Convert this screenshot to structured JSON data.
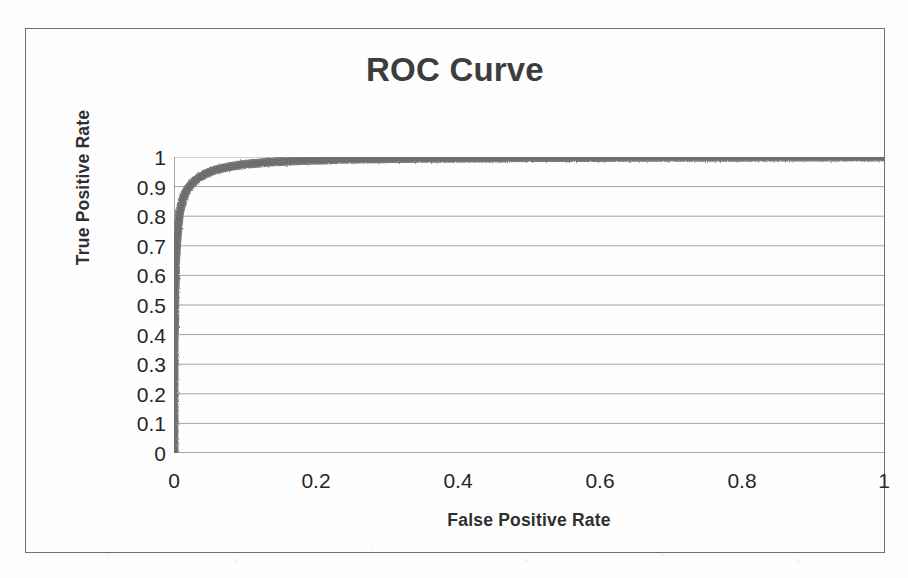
{
  "chart_data": {
    "type": "line",
    "title": "ROC Curve",
    "xlabel": "False Positive Rate",
    "ylabel": "True Positive Rate",
    "xlim": [
      0,
      1
    ],
    "ylim": [
      0,
      1
    ],
    "grid": true,
    "legend": "none",
    "series_color": "#7b7b7b",
    "x_ticks": [
      "0",
      "0.2",
      "0.4",
      "0.6",
      "0.8",
      "1"
    ],
    "x_tick_values": [
      0,
      0.2,
      0.4,
      0.6,
      0.8,
      1
    ],
    "y_ticks": [
      "0",
      "0.1",
      "0.2",
      "0.3",
      "0.4",
      "0.5",
      "0.6",
      "0.7",
      "0.8",
      "0.9",
      "1"
    ],
    "y_tick_values": [
      0,
      0.1,
      0.2,
      0.3,
      0.4,
      0.5,
      0.6,
      0.7,
      0.8,
      0.9,
      1
    ],
    "series": [
      {
        "name": "ROC",
        "x": [
          0.0,
          0.0,
          0.0,
          0.0,
          0.001,
          0.001,
          0.002,
          0.002,
          0.003,
          0.004,
          0.005,
          0.006,
          0.007,
          0.008,
          0.01,
          0.012,
          0.014,
          0.016,
          0.018,
          0.021,
          0.024,
          0.027,
          0.031,
          0.035,
          0.04,
          0.045,
          0.051,
          0.058,
          0.066,
          0.075,
          0.085,
          0.096,
          0.108,
          0.121,
          0.136,
          0.152,
          0.17,
          0.19,
          0.212,
          0.236,
          0.262,
          0.29,
          0.32,
          0.352,
          0.386,
          0.422,
          0.46,
          0.5,
          0.545,
          0.592,
          0.64,
          0.69,
          0.742,
          0.796,
          0.85,
          0.905,
          0.952,
          1.0
        ],
        "y": [
          0.0,
          0.12,
          0.25,
          0.37,
          0.46,
          0.53,
          0.59,
          0.64,
          0.68,
          0.715,
          0.745,
          0.772,
          0.795,
          0.815,
          0.835,
          0.852,
          0.866,
          0.878,
          0.888,
          0.898,
          0.907,
          0.915,
          0.923,
          0.93,
          0.937,
          0.944,
          0.95,
          0.956,
          0.961,
          0.966,
          0.97,
          0.974,
          0.977,
          0.98,
          0.983,
          0.985,
          0.987,
          0.989,
          0.99,
          0.992,
          0.993,
          0.994,
          0.995,
          0.996,
          0.996,
          0.997,
          0.997,
          0.998,
          0.998,
          0.998,
          0.999,
          0.999,
          0.999,
          0.999,
          1.0,
          1.0,
          1.0,
          1.0
        ]
      }
    ]
  }
}
